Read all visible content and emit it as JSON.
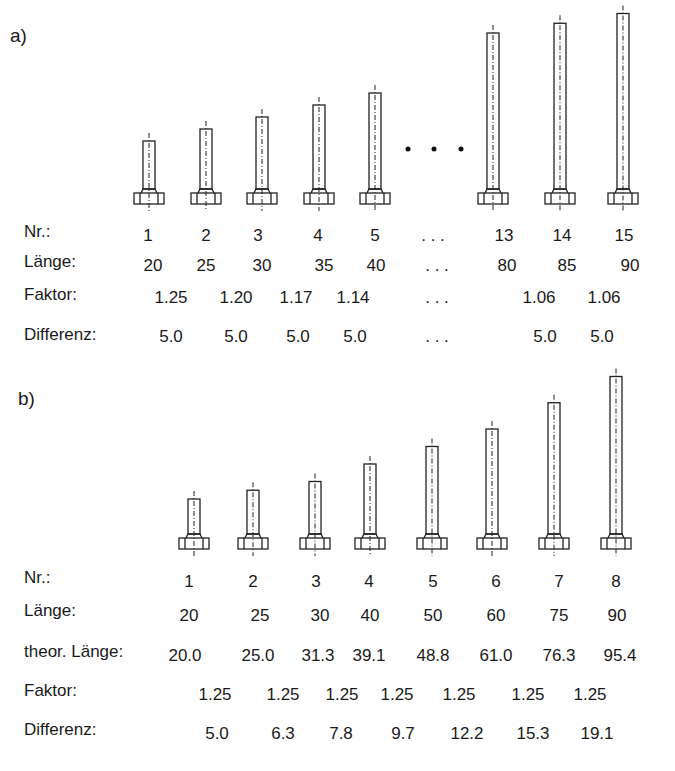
{
  "panels": [
    {
      "label": "a)",
      "bolt_lengths": [
        20,
        25,
        30,
        35,
        40,
        null,
        80,
        85,
        90
      ],
      "rows": [
        {
          "label": "Nr.:",
          "cells": [
            "1",
            "2",
            "3",
            "4",
            "5",
            ". . .",
            "13",
            "14",
            "15"
          ]
        },
        {
          "label": "Länge:",
          "cells": [
            "20",
            "25",
            "30",
            "35",
            "40",
            ". . .",
            "80",
            "85",
            "90"
          ]
        },
        {
          "label": "Faktor:",
          "cells": [
            "1.25",
            "1.20",
            "1.17",
            "1.14",
            ". . .",
            "1.06",
            "1.06"
          ]
        },
        {
          "label": "Differenz:",
          "cells": [
            "5.0",
            "5.0",
            "5.0",
            "5.0",
            ". . .",
            "5.0",
            "5.0"
          ]
        }
      ]
    },
    {
      "label": "b)",
      "bolt_lengths": [
        20,
        25,
        30,
        40,
        50,
        60,
        75,
        90
      ],
      "rows": [
        {
          "label": "Nr.:",
          "cells": [
            "1",
            "2",
            "3",
            "4",
            "5",
            "6",
            "7",
            "8"
          ]
        },
        {
          "label": "Länge:",
          "cells": [
            "20",
            "25",
            "30",
            "40",
            "50",
            "60",
            "75",
            "90"
          ]
        },
        {
          "label": "theor. Länge:",
          "cells": [
            "20.0",
            "25.0",
            "31.3",
            "39.1",
            "48.8",
            "61.0",
            "76.3",
            "95.4"
          ]
        },
        {
          "label": "Faktor:",
          "cells": [
            "1.25",
            "1.25",
            "1.25",
            "1.25",
            "1.25",
            "1.25",
            "1.25"
          ]
        },
        {
          "label": "Differenz:",
          "cells": [
            "5.0",
            "6.3",
            "7.8",
            "9.7",
            "12.2",
            "15.3",
            "19.1"
          ]
        }
      ]
    }
  ],
  "chart_data": {
    "type": "table",
    "series": [
      {
        "name": "a) Länge",
        "x": [
          1,
          2,
          3,
          4,
          5,
          13,
          14,
          15
        ],
        "values": [
          20,
          25,
          30,
          35,
          40,
          80,
          85,
          90
        ],
        "faktor": [
          1.25,
          1.2,
          1.17,
          1.14,
          1.06,
          1.06
        ],
        "differenz": [
          5.0,
          5.0,
          5.0,
          5.0,
          5.0,
          5.0
        ]
      },
      {
        "name": "b) Länge",
        "x": [
          1,
          2,
          3,
          4,
          5,
          6,
          7,
          8
        ],
        "values": [
          20,
          25,
          30,
          40,
          50,
          60,
          75,
          90
        ],
        "theor_laenge": [
          20.0,
          25.0,
          31.3,
          39.1,
          48.8,
          61.0,
          76.3,
          95.4
        ],
        "faktor": [
          1.25,
          1.25,
          1.25,
          1.25,
          1.25,
          1.25,
          1.25
        ],
        "differenz": [
          5.0,
          6.3,
          7.8,
          9.7,
          12.2,
          15.3,
          19.1
        ]
      }
    ]
  }
}
